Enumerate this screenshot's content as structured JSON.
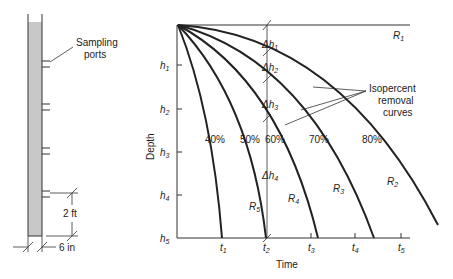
{
  "column": {
    "sampling_label_line1": "Sampling",
    "sampling_label_line2": "ports",
    "height_dim": "2 ft",
    "width_dim": "6 in"
  },
  "axes": {
    "ylabel": "Depth",
    "xlabel": "Time",
    "y_ticks": [
      {
        "base": "h",
        "sub": "1"
      },
      {
        "base": "h",
        "sub": "2"
      },
      {
        "base": "h",
        "sub": "3"
      },
      {
        "base": "h",
        "sub": "4"
      },
      {
        "base": "h",
        "sub": "5"
      }
    ],
    "x_ticks": [
      {
        "base": "t",
        "sub": "1"
      },
      {
        "base": "t",
        "sub": "2"
      },
      {
        "base": "t",
        "sub": "3"
      },
      {
        "base": "t",
        "sub": "4"
      },
      {
        "base": "t",
        "sub": "5"
      }
    ]
  },
  "curves": {
    "labels": [
      "40%",
      "50%",
      "60%",
      "70%",
      "80%"
    ],
    "annotation_line1": "Isopercent",
    "annotation_line2": "removal",
    "annotation_line3": "curves"
  },
  "deltas": [
    {
      "base": "Δh",
      "sub": "1"
    },
    {
      "base": "Δh",
      "sub": "2"
    },
    {
      "base": "Δh",
      "sub": "3"
    },
    {
      "base": "Δh",
      "sub": "4"
    }
  ],
  "regions": [
    {
      "base": "R",
      "sub": "1"
    },
    {
      "base": "R",
      "sub": "2"
    },
    {
      "base": "R",
      "sub": "3"
    },
    {
      "base": "R",
      "sub": "4"
    },
    {
      "base": "R",
      "sub": "5"
    }
  ],
  "colors": {
    "column_fill": "#c8c8c8",
    "line": "#222222"
  }
}
